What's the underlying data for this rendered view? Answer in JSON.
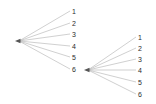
{
  "diagram": {
    "type": "two-fan-node-link-diagram",
    "background_color": "#ffffff",
    "edge_color": "#b0b0b0",
    "arrow_color": "#555555",
    "label_color": "#2b2b2b",
    "width": 156,
    "height": 104,
    "clusters": [
      {
        "id": "left-fan",
        "hub": {
          "name": "left-hub",
          "x": 15,
          "y": 41,
          "has_arrowhead": true,
          "arrow_direction": "left"
        },
        "leaves": [
          {
            "label": "1",
            "x": 74,
            "y": 11
          },
          {
            "label": "2",
            "x": 74,
            "y": 23
          },
          {
            "label": "3",
            "x": 74,
            "y": 34
          },
          {
            "label": "4",
            "x": 74,
            "y": 46
          },
          {
            "label": "5",
            "x": 74,
            "y": 57
          },
          {
            "label": "6",
            "x": 74,
            "y": 69
          }
        ]
      },
      {
        "id": "right-fan",
        "hub": {
          "name": "right-hub",
          "x": 84,
          "y": 70,
          "has_arrowhead": true,
          "arrow_direction": "left"
        },
        "leaves": [
          {
            "label": "1",
            "x": 140,
            "y": 37
          },
          {
            "label": "2",
            "x": 140,
            "y": 48
          },
          {
            "label": "3",
            "x": 140,
            "y": 59
          },
          {
            "label": "4",
            "x": 140,
            "y": 70
          },
          {
            "label": "5",
            "x": 140,
            "y": 82
          },
          {
            "label": "6",
            "x": 140,
            "y": 94
          }
        ]
      }
    ]
  }
}
